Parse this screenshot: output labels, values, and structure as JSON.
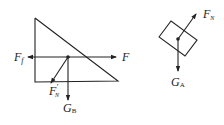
{
  "diagram": {
    "left_figure": {
      "shape": "right triangle (wedge B)",
      "labels": {
        "friction": {
          "main": "F",
          "sub": "f"
        },
        "applied": {
          "main": "F",
          "sub": ""
        },
        "normal_reaction": {
          "main": "F",
          "prime": "′",
          "sub": "N"
        },
        "weight": {
          "main": "G",
          "sub": "B"
        }
      }
    },
    "right_figure": {
      "shape": "tilted block (A)",
      "labels": {
        "normal": {
          "main": "F",
          "sub": "N"
        },
        "weight": {
          "main": "G",
          "sub": "A"
        }
      }
    },
    "colors": {
      "stroke": "#222222",
      "background": "#ffffff"
    }
  }
}
